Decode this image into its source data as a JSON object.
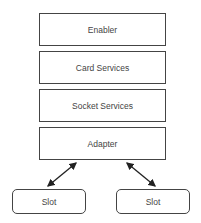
{
  "diagram": {
    "layers": [
      {
        "label": "Enabler"
      },
      {
        "label": "Card Services"
      },
      {
        "label": "Socket Services"
      },
      {
        "label": "Adapter"
      }
    ],
    "slots": [
      {
        "label": "Slot"
      },
      {
        "label": "Slot"
      }
    ],
    "connections": [
      {
        "from": "Adapter",
        "to": "Slot (left)",
        "type": "bidirectional-arrow"
      },
      {
        "from": "Adapter",
        "to": "Slot (right)",
        "type": "bidirectional-arrow"
      }
    ],
    "colors": {
      "stroke": "#444444",
      "background": "#ffffff"
    }
  }
}
